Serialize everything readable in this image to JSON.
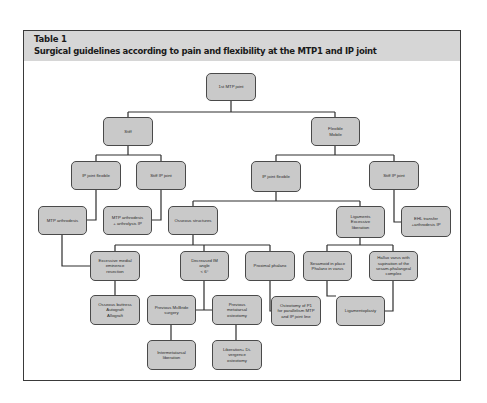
{
  "table": {
    "label": "Table 1",
    "title": "Surgical guidelines according to pain and flexibility at the MTP1 and IP joint"
  },
  "colors": {
    "header_bg": "#d6d6d6",
    "node_fill": "#c9c9c9",
    "node_border": "#4a4a4a",
    "connector": "#2e2e2e"
  },
  "nodes": {
    "root": "1st MTP joint",
    "stiff": "Stiff",
    "flexible": "Flexible\nMobile",
    "stiff_ip_flexible": "IP joint flexible",
    "stiff_ip_stiff": "Stiff IP joint",
    "mtp_arthrodesis": "MTP arthrodesis",
    "mtp_arthrodesis_arthrolysis": "MTP arthrodesis\n+ arthrolysis IP",
    "flex_ip_flexible": "IP joint flexible",
    "flex_ip_stiff": "Stiff IP joint",
    "osseous": "Osseous structures",
    "ligaments": "Ligaments\nExcessive\nliberation",
    "ehl": "EHL transfer\n+arthrodesis IP",
    "eminence": "Excessive medial\neminence\nresection",
    "decreased_im": "Decreased IM\nangle\n< 6°",
    "proximal_phalanx": "Proximal phalanx",
    "sesamoid": "Sesamoid in place\nPhalanx in varus",
    "hallux_varus": "Hallux varus with\nsupination of the\nsesam-phalangeal\ncomplex",
    "buttress": "Osseous buttress\nAutograft\nAllograft",
    "mcbride": "Previous McBride\nsurgery",
    "prev_osteotomy": "Previous\nmetatarsal\nosteotomy",
    "p1_osteotomy": "Osteotomy of P1\nfor parallelism MTP\nand IP joint line",
    "ligamentoplasty": "Ligamentoplasty",
    "intermetatarsal": "Intermetatarsal\nliberation",
    "divergence": "Liberation+ Di-\nvergence\nosteotomy"
  }
}
